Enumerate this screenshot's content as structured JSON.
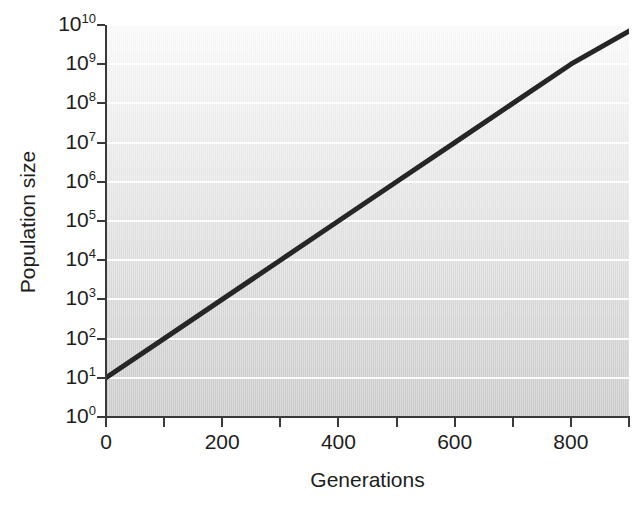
{
  "chart_data": {
    "type": "line",
    "title": "",
    "subtitle": "",
    "xlabel": "Generations",
    "ylabel": "Population size",
    "xlim": [
      0,
      900
    ],
    "ylim": [
      1,
      10000000000
    ],
    "yscale": "log",
    "xscale": "linear",
    "grid": "horizontal",
    "legend": "none",
    "x_ticks_major": [
      0,
      200,
      400,
      600,
      800
    ],
    "x_tick_labels": [
      "0",
      "200",
      "400",
      "600",
      "800"
    ],
    "x_ticks_minor": [
      100,
      300,
      500,
      700,
      900
    ],
    "y_ticks": [
      1,
      10,
      100,
      1000,
      10000,
      100000,
      1000000,
      10000000,
      100000000,
      1000000000,
      10000000000
    ],
    "y_tick_labels": [
      {
        "base": "10",
        "exp": "0"
      },
      {
        "base": "10",
        "exp": "1"
      },
      {
        "base": "10",
        "exp": "2"
      },
      {
        "base": "10",
        "exp": "3"
      },
      {
        "base": "10",
        "exp": "4"
      },
      {
        "base": "10",
        "exp": "5"
      },
      {
        "base": "10",
        "exp": "6"
      },
      {
        "base": "10",
        "exp": "7"
      },
      {
        "base": "10",
        "exp": "8"
      },
      {
        "base": "10",
        "exp": "9"
      },
      {
        "base": "10",
        "exp": "10"
      }
    ],
    "series": [
      {
        "name": "Population size",
        "color": "#262626",
        "line_width": 5,
        "x": [
          0,
          100,
          200,
          300,
          400,
          500,
          600,
          700,
          800,
          900
        ],
        "y": [
          10,
          100,
          1000,
          10000,
          100000,
          1000000,
          10000000,
          100000000,
          1000000000,
          7000000000
        ],
        "annotation": "Straight line on log scale indicates constant exponential growth; population multiplies tenfold roughly every 100 generations."
      }
    ],
    "colors": {
      "line": "#262626",
      "gridline": "#ffffff",
      "axis": "#3a3a3a",
      "panel_top": "#fbfbfb",
      "panel_bottom": "#cbcbcb",
      "figure_background": "#ffffff",
      "text": "#1d1d1d"
    }
  }
}
